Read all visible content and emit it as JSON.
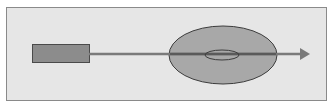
{
  "diagram": {
    "type": "schematic",
    "colors": {
      "background": "#ffffff",
      "panel_fill": "#e6e6e6",
      "panel_border": "#8a8a8a",
      "source_fill": "#8c8c8c",
      "source_border": "#4a4a4a",
      "ray": "#7a7a7a",
      "outer_ellipse_fill": "#a8a8a8",
      "outer_ellipse_border": "#3c3c3c",
      "inner_ellipse_border": "#3c3c3c"
    },
    "elements": [
      {
        "name": "source-rectangle",
        "shape": "rect"
      },
      {
        "name": "ray-line",
        "shape": "line"
      },
      {
        "name": "outer-ellipse",
        "shape": "ellipse"
      },
      {
        "name": "inner-ellipse",
        "shape": "ellipse"
      },
      {
        "name": "arrowhead",
        "shape": "triangle"
      }
    ]
  }
}
